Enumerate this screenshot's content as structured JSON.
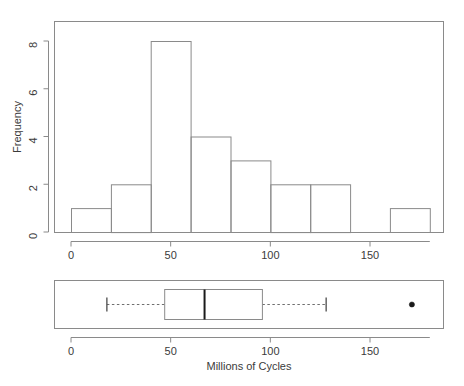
{
  "figure": {
    "background_color": "#ffffff",
    "line_color": "#8a8a8a",
    "text_color": "#3b3b3b",
    "accent_color": "#1a1a1a"
  },
  "chart_data": [
    {
      "type": "bar",
      "name": "histogram",
      "title": "",
      "xlabel": "",
      "ylabel": "Frequency",
      "bin_width": 20,
      "bin_edges": [
        0,
        20,
        40,
        60,
        80,
        100,
        120,
        140,
        160,
        180
      ],
      "categories": [
        "0-20",
        "20-40",
        "40-60",
        "60-80",
        "80-100",
        "100-120",
        "120-140",
        "140-160",
        "160-180"
      ],
      "values": [
        1,
        2,
        8,
        4,
        3,
        2,
        2,
        0,
        1
      ],
      "xlim": [
        0,
        180
      ],
      "ylim": [
        0,
        8.6
      ],
      "xticks": [
        0,
        50,
        100,
        150
      ],
      "xticklabels": [
        "0",
        "50",
        "100",
        "150"
      ],
      "yticks": [
        0,
        2,
        4,
        6,
        8
      ],
      "yticklabels": [
        "0",
        "2",
        "4",
        "6",
        "8"
      ],
      "grid": false,
      "legend": "none",
      "n": 23
    },
    {
      "type": "boxplot",
      "name": "boxplot",
      "title": "",
      "xlabel": "Millions of Cycles",
      "ylabel": "",
      "orientation": "horizontal",
      "lower_whisker": 18,
      "q1": 47,
      "median": 67,
      "q3": 96,
      "upper_whisker": 128,
      "outliers": [
        171
      ],
      "xlim": [
        0,
        180
      ],
      "xticks": [
        0,
        50,
        100,
        150
      ],
      "xticklabels": [
        "0",
        "50",
        "100",
        "150"
      ],
      "grid": false,
      "legend": "none"
    }
  ],
  "histogram": {
    "y_axis_title": "Frequency",
    "x_tick_labels": [
      "0",
      "50",
      "100",
      "150"
    ],
    "y_tick_labels": [
      "0",
      "2",
      "4",
      "6",
      "8"
    ]
  },
  "boxplot": {
    "x_axis_title": "Millions of Cycles",
    "x_tick_labels": [
      "0",
      "50",
      "100",
      "150"
    ]
  }
}
